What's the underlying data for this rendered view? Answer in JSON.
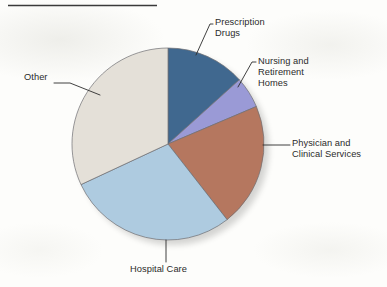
{
  "page": {
    "background_color": "#fdfdfb",
    "rule_color": "#3a3a3a"
  },
  "chart_data": {
    "type": "pie",
    "title": "",
    "subtitle": "",
    "xlabel": "",
    "ylabel": "",
    "legend_position": "callout-labels",
    "grid": false,
    "start_angle_deg": 0,
    "direction": "clockwise",
    "center": {
      "x": 168,
      "y": 144
    },
    "radius": 96,
    "categories": [
      "Prescription Drugs",
      "Nursing and Retirement Homes",
      "Physician and Clinical Services",
      "Hospital Care",
      "Other"
    ],
    "values": [
      13,
      5,
      21,
      29,
      32
    ],
    "colors": [
      "#40688f",
      "#9a9ad6",
      "#b5775f",
      "#aecbe0",
      "#e4e0d8"
    ],
    "slices": [
      {
        "label": "Prescription Drugs",
        "value": 13,
        "color": "#40688f",
        "start_angle_deg": 0,
        "end_angle_deg": 48
      },
      {
        "label": "Nursing and Retirement Homes",
        "value": 5,
        "color": "#9a9ad6",
        "start_angle_deg": 48,
        "end_angle_deg": 67
      },
      {
        "label": "Physician and Clinical Services",
        "value": 21,
        "color": "#b5775f",
        "start_angle_deg": 67,
        "end_angle_deg": 142
      },
      {
        "label": "Hospital Care",
        "value": 29,
        "color": "#aecbe0",
        "start_angle_deg": 142,
        "end_angle_deg": 245
      },
      {
        "label": "Other",
        "value": 32,
        "color": "#e4e0d8",
        "start_angle_deg": 245,
        "end_angle_deg": 360
      }
    ]
  },
  "labels": {
    "prescription_drugs": "Prescription\nDrugs",
    "nursing_homes": "Nursing and\nRetirement\nHomes",
    "physician_clinical": "Physician and\nClinical Services",
    "other": "Other",
    "hospital_care": "Hospital Care"
  }
}
